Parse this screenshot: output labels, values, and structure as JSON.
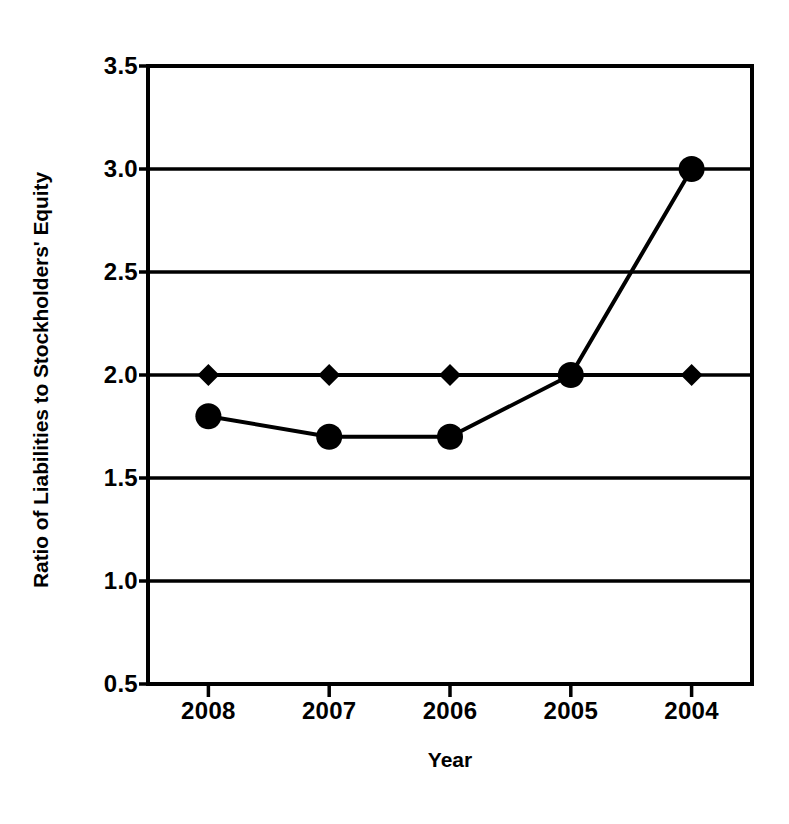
{
  "chart_data": {
    "type": "line",
    "title": "",
    "subtitle": "",
    "xlabel": "Year",
    "ylabel": "Ratio of Liabilities to Stockholders' Equity",
    "categories": [
      "2008",
      "2007",
      "2006",
      "2005",
      "2004"
    ],
    "series": [
      {
        "name": "Benchmark",
        "marker": "diamond",
        "values": [
          2.0,
          2.0,
          2.0,
          2.0,
          2.0
        ]
      },
      {
        "name": "Company",
        "marker": "circle",
        "values": [
          1.8,
          1.7,
          1.7,
          2.0,
          3.0
        ]
      }
    ],
    "ylim": [
      0.5,
      3.5
    ],
    "ytick_values": [
      0.5,
      1.0,
      1.5,
      2.0,
      2.5,
      3.0,
      3.5
    ],
    "ytick_labels": [
      "0.5",
      "1.0",
      "1.5",
      "2.0",
      "2.5",
      "3.0",
      "3.5"
    ],
    "xtick_labels": [
      "2008",
      "2007",
      "2006",
      "2005",
      "2004"
    ],
    "grid": "horizontal",
    "legend": "none",
    "colors": {
      "line": "#000000",
      "marker": "#000000",
      "axis": "#000000",
      "grid": "#000000",
      "background": "#ffffff"
    }
  }
}
